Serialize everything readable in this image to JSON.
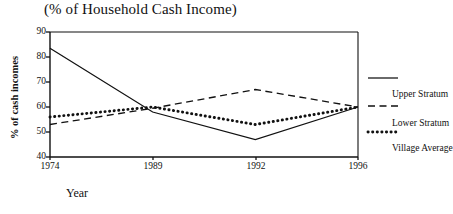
{
  "chart_data": {
    "type": "line",
    "title": "(% of Household Cash Income)",
    "xlabel": "Year",
    "ylabel": "% of cash incomes",
    "categories": [
      "1974",
      "1989",
      "1992",
      "1996"
    ],
    "xticklabels": [
      "1974",
      "1989",
      "1992",
      "1996"
    ],
    "yticklabels": [
      "40",
      "50",
      "60",
      "70",
      "80",
      "90"
    ],
    "yticks": [
      40,
      50,
      60,
      70,
      80,
      90
    ],
    "ylim": [
      40,
      90
    ],
    "grid": false,
    "legend_position": "right-outside",
    "series": [
      {
        "name": "Upper Stratum",
        "style": "solid",
        "color": "#111111",
        "values": [
          83.5,
          58.0,
          47.0,
          60.0
        ]
      },
      {
        "name": "Lower Stratum",
        "style": "dashed",
        "color": "#111111",
        "values": [
          53.0,
          59.5,
          67.0,
          60.0
        ]
      },
      {
        "name": "Village Average",
        "style": "dotted",
        "color": "#111111",
        "values": [
          56.0,
          60.0,
          53.0,
          60.0
        ]
      }
    ]
  },
  "legend": {
    "items": [
      {
        "label": "Upper Stratum",
        "style": "solid"
      },
      {
        "label": "Lower Stratum",
        "style": "dashed"
      },
      {
        "label": "Village Average",
        "style": "dotted"
      }
    ]
  },
  "colors": {
    "ink": "#111111",
    "background": "#ffffff"
  }
}
